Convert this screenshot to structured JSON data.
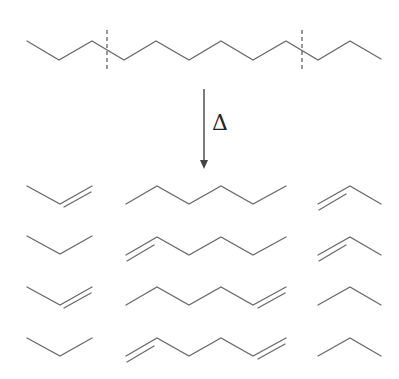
{
  "diagram": {
    "arrow_label": "Δ",
    "colors": {
      "bond": "#6a6a6a",
      "cut": "#555555",
      "arrow": "#444444"
    },
    "reactant": {
      "name": "dodecane (skeletal)",
      "points": [
        [
          27,
          41
        ],
        [
          59,
          60
        ],
        [
          92,
          41
        ],
        [
          124,
          60
        ],
        [
          156,
          41
        ],
        [
          189,
          60
        ],
        [
          221,
          41
        ],
        [
          253,
          60
        ],
        [
          286,
          41
        ],
        [
          318,
          60
        ],
        [
          350,
          41
        ],
        [
          381,
          59
        ]
      ],
      "cut_lines_x": [
        107,
        302
      ],
      "cut_y_range": [
        30,
        72
      ]
    },
    "products": [
      {
        "row": 1,
        "left": "propene (double bond right)",
        "middle": "hexane",
        "right": "propene (double bond left)"
      },
      {
        "row": 2,
        "left": "propane",
        "middle": "1-hexene (double bond left)",
        "right": "propene (double bond left)"
      },
      {
        "row": 3,
        "left": "propene (double bond right)",
        "middle": "1-hexene (double bond right)",
        "right": "propane"
      },
      {
        "row": 4,
        "left": "propane",
        "middle": "1,5-hexadiene (double bonds both ends)",
        "right": "propane"
      }
    ]
  }
}
